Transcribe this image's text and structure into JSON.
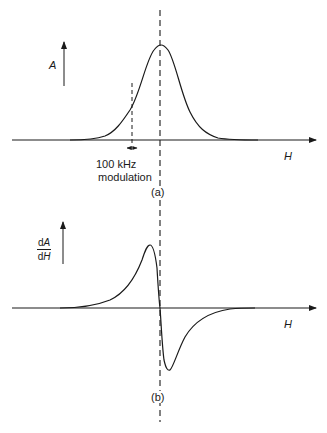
{
  "figure": {
    "panel_a": {
      "label": "(a)",
      "y_axis_label": "A",
      "x_axis_label": "H",
      "modulation_label_line1": "100 kHz",
      "modulation_label_line2": "modulation",
      "curve": "absorption peak centered at resonance field"
    },
    "panel_b": {
      "label": "(b)",
      "y_axis_label_numerator_d": "d",
      "y_axis_label_numerator_var": "A",
      "y_axis_label_denominator_d": "d",
      "y_axis_label_denominator_var": "H",
      "x_axis_label": "H",
      "curve": "first-derivative signal crossing zero at resonance field"
    },
    "colors": {
      "line": "#1a1a1a",
      "background": "#ffffff"
    }
  }
}
